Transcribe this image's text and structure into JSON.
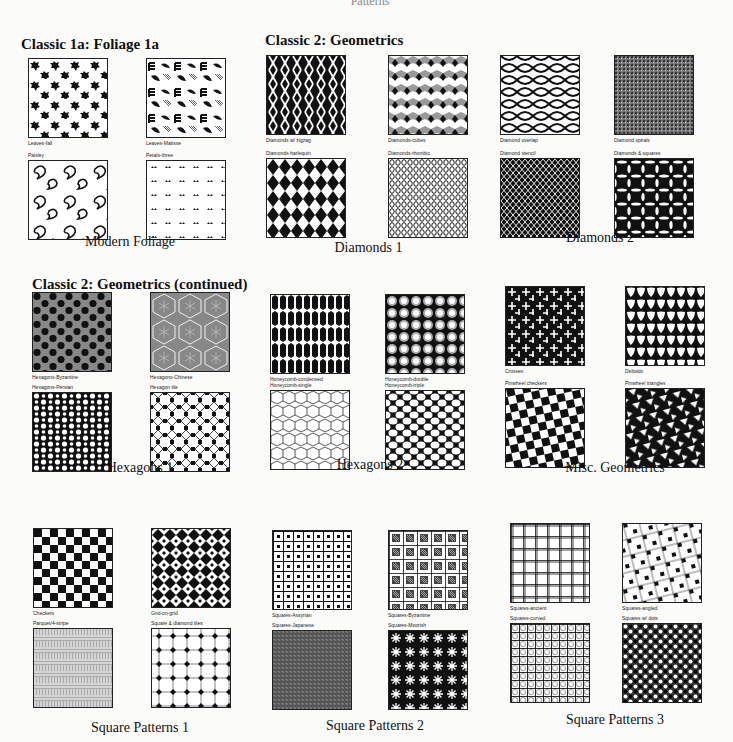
{
  "page": {
    "top_fragment": "Patterns"
  },
  "sections": [
    {
      "id": "classic1a",
      "title": "Classic 1a: Foliage 1a"
    },
    {
      "id": "classic2",
      "title": "Classic 2: Geometrics"
    },
    {
      "id": "classic2cont",
      "title": "Classic 2: Geometrics (continued)"
    }
  ],
  "groups": [
    {
      "caption": "Modern Foliage",
      "swatches": [
        {
          "label": "Leaves-fall",
          "pattern": "leaves"
        },
        {
          "label": "Leaves-Matisse",
          "pattern": "matisse"
        },
        {
          "label": "Paisley",
          "pattern": "paisley"
        },
        {
          "label": "Petals-three",
          "pattern": "petals"
        }
      ]
    },
    {
      "caption": "Diamonds 1",
      "swatches": [
        {
          "label": "Diamonds w/ zigzag",
          "pattern": "zigzag"
        },
        {
          "label": "Diamonds-cubes",
          "pattern": "cubes"
        },
        {
          "label": "Diamonds-harlequin",
          "pattern": "harlequin"
        },
        {
          "label": "Diamonds-rhombic",
          "pattern": "rhombic"
        }
      ]
    },
    {
      "caption": "Diamonds 2",
      "swatches": [
        {
          "label": "Diamond overlap",
          "pattern": "overlap"
        },
        {
          "label": "Diamond spirals",
          "pattern": "spirals"
        },
        {
          "label": "Diamond stencil",
          "pattern": "stencil"
        },
        {
          "label": "Diamonds & squares",
          "pattern": "diamondsq"
        }
      ]
    },
    {
      "caption": "Hexagons 1",
      "swatches": [
        {
          "label": "Hexagons-Byzantine",
          "pattern": "byzantine"
        },
        {
          "label": "Hexagons-Chinese",
          "pattern": "chinese"
        },
        {
          "label": "Hexagons-Persian",
          "pattern": "persian"
        },
        {
          "label": "Hexagon tile",
          "pattern": "hextile"
        }
      ]
    },
    {
      "caption": "Hexagons 2",
      "swatches": [
        {
          "label": "Honeycomb-condensed",
          "pattern": "condensed"
        },
        {
          "label": "Honeycomb-double",
          "pattern": "double"
        },
        {
          "label": "Honeycomb-single",
          "pattern": "single"
        },
        {
          "label": "Honeycomb-triple",
          "pattern": "triple"
        }
      ]
    },
    {
      "caption": "Misc. Geometrics",
      "swatches": [
        {
          "label": "Crosses",
          "pattern": "crosses"
        },
        {
          "label": "Deltoids",
          "pattern": "deltoids"
        },
        {
          "label": "Pinwheel checkers",
          "pattern": "pinwheel"
        },
        {
          "label": "Pinwheel triangles",
          "pattern": "pintri"
        }
      ]
    },
    {
      "caption": "Square Patterns 1",
      "swatches": [
        {
          "label": "Checkers",
          "pattern": "checkers"
        },
        {
          "label": "Grid-on-grid",
          "pattern": "gridongrid"
        },
        {
          "label": "Parquet/4-stripe",
          "pattern": "parquet"
        },
        {
          "label": "Square & diamond tiles",
          "pattern": "sqdiamond"
        }
      ]
    },
    {
      "caption": "Square Patterns 2",
      "swatches": [
        {
          "label": "Squares-Assyrian",
          "pattern": "assyrian"
        },
        {
          "label": "Squares-Byzantine",
          "pattern": "sqbyz"
        },
        {
          "label": "Squares-Japanese",
          "pattern": "japanese"
        },
        {
          "label": "Squares-Moorish",
          "pattern": "moorish"
        }
      ]
    },
    {
      "caption": "Square Patterns 3",
      "swatches": [
        {
          "label": "Squares-ancient",
          "pattern": "ancient"
        },
        {
          "label": "Squares-angled",
          "pattern": "angled"
        },
        {
          "label": "Squares-curved",
          "pattern": "curved"
        },
        {
          "label": "Squares w/ dots",
          "pattern": "dots"
        }
      ]
    }
  ]
}
